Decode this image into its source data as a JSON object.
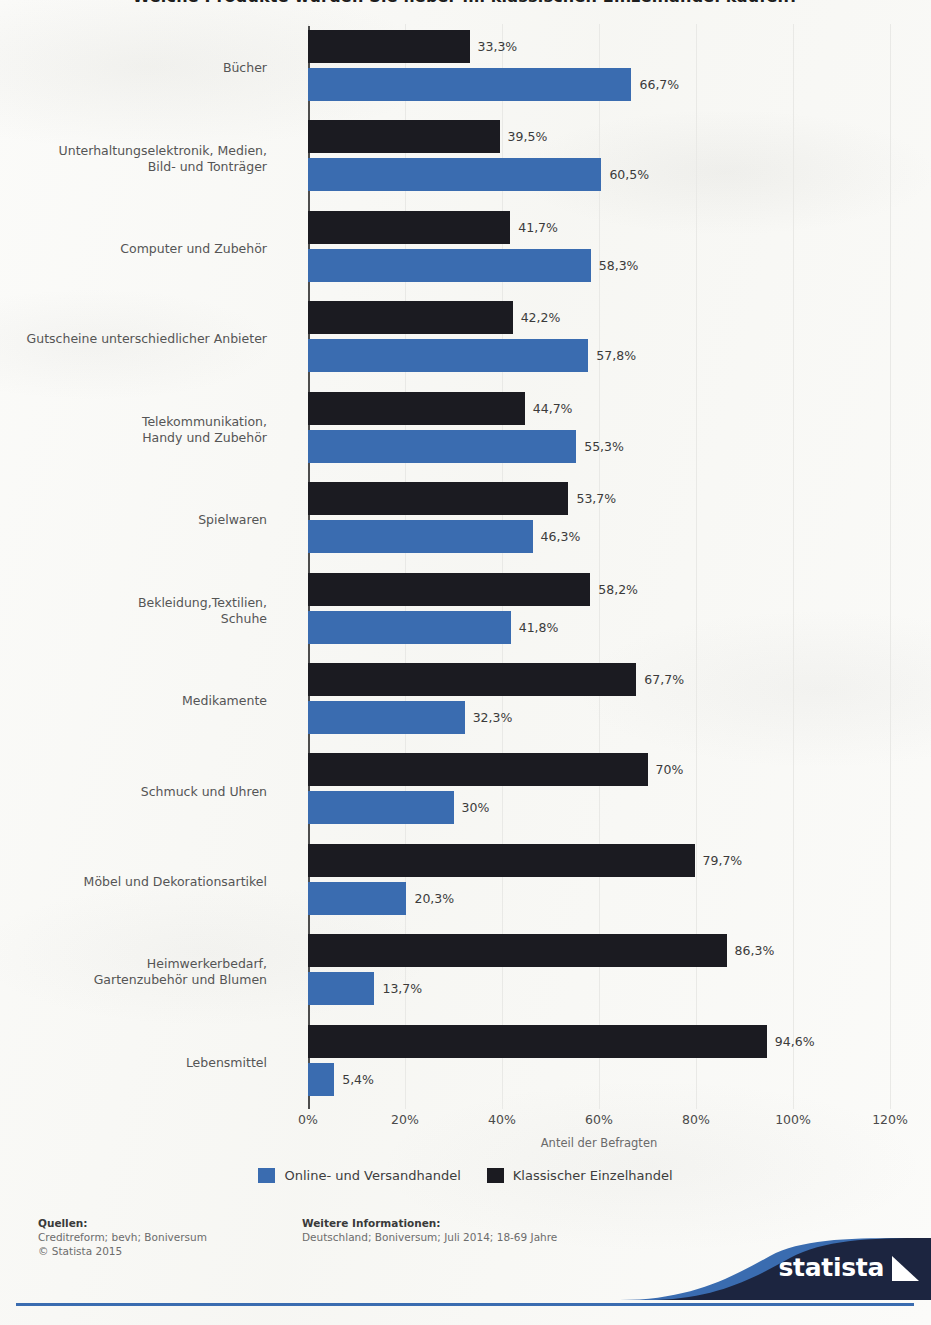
{
  "title": "Welche Produkte würden Sie lieber im klassischen Einzelhandel kaufen?",
  "chart_data": {
    "type": "bar",
    "orientation": "horizontal",
    "title": "Welche Produkte würden Sie lieber im klassischen Einzelhandel kaufen?",
    "xlabel": "Anteil der Befragten",
    "ylabel": "",
    "xlim": [
      0,
      120
    ],
    "xticks": [
      "0%",
      "20%",
      "40%",
      "60%",
      "80%",
      "100%",
      "120%"
    ],
    "xtick_values": [
      0,
      20,
      40,
      60,
      80,
      100,
      120
    ],
    "grid": true,
    "legend_position": "bottom",
    "categories": [
      "Bücher",
      "Unterhaltungselektronik, Medien,\nBild- und Tonträger",
      "Computer und Zubehör",
      "Gutscheine unterschiedlicher Anbieter",
      "Telekommunikation,\nHandy und Zubehör",
      "Spielwaren",
      "Bekleidung,Textilien,\nSchuhe",
      "Medikamente",
      "Schmuck und Uhren",
      "Möbel und Dekorationsartikel",
      "Heimwerkerbedarf,\nGartenzubehör und Blumen",
      "Lebensmittel"
    ],
    "series": [
      {
        "name": "Klassischer Einzelhandel",
        "color": "#1b1b21",
        "values": [
          33.3,
          39.5,
          41.7,
          42.2,
          44.7,
          53.7,
          58.2,
          67.7,
          70,
          79.7,
          86.3,
          94.6
        ],
        "labels": [
          "33,3%",
          "39,5%",
          "41,7%",
          "42,2%",
          "44,7%",
          "53,7%",
          "58,2%",
          "67,7%",
          "70%",
          "79,7%",
          "86,3%",
          "94,6%"
        ]
      },
      {
        "name": "Online- und Versandhandel",
        "color": "#3a6cb0",
        "values": [
          66.7,
          60.5,
          58.3,
          57.8,
          55.3,
          46.3,
          41.8,
          32.3,
          30,
          20.3,
          13.7,
          5.4
        ],
        "labels": [
          "66,7%",
          "60,5%",
          "58,3%",
          "57,8%",
          "55,3%",
          "46,3%",
          "41,8%",
          "32,3%",
          "30%",
          "20,3%",
          "13,7%",
          "5,4%"
        ]
      }
    ]
  },
  "legend": [
    {
      "label": "Online- und Versandhandel",
      "color": "#3a6cb0"
    },
    {
      "label": "Klassischer Einzelhandel",
      "color": "#1b1b21"
    }
  ],
  "footer": {
    "sources_head": "Quellen:",
    "sources_line1": "Creditreform; bevh; Boniversum",
    "sources_line2": "© Statista 2015",
    "info_head": "Weitere Informationen:",
    "info_line1": "Deutschland; Boniversum; Juli 2014; 18-69 Jahre"
  },
  "brand": {
    "name": "statista"
  },
  "colors": {
    "black_series": "#1b1b21",
    "blue_series": "#3a6cb0",
    "brand_navy": "#1c2540",
    "brand_blue": "#3a6cb0",
    "background": "#fbfbf9"
  }
}
